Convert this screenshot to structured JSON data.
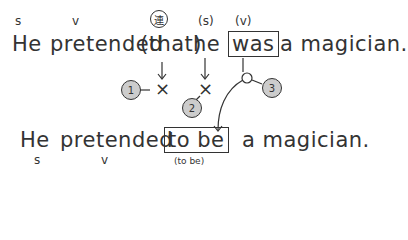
{
  "diagram": {
    "sentence1": {
      "labels": {
        "s": "s",
        "v": "v",
        "conj": "連",
        "s2": "(s)",
        "v2": "(v)"
      },
      "words": {
        "he": "He",
        "pretended": "pretended",
        "that": "(that)",
        "he2": "he",
        "was": "was",
        "rest": "a magician."
      }
    },
    "marks": {
      "cross1": "×",
      "cross2": "×",
      "callout1": "1",
      "callout2": "2",
      "callout3": "3"
    },
    "sentence2": {
      "words": {
        "he": "He",
        "pretended": "pretended",
        "to_be": "to be",
        "rest": "a magician."
      },
      "labels": {
        "s": "s",
        "v": "v",
        "to_be_note": "(to be)"
      }
    }
  }
}
